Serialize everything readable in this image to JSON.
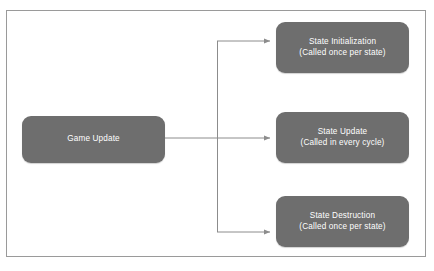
{
  "diagram": {
    "type": "flowchart",
    "colors": {
      "node_fill": "#6e6e6e",
      "node_text": "#ffffff",
      "connector": "#8c8c8c",
      "frame_border": "#9a9a9a",
      "background": "#ffffff"
    },
    "source_node": {
      "id": "game-update",
      "title": "Game Update",
      "subtitle": ""
    },
    "target_nodes": [
      {
        "id": "state-initialization",
        "title": "State Initialization",
        "subtitle": "(Called once per state)"
      },
      {
        "id": "state-update",
        "title": "State Update",
        "subtitle": "(Called in every cycle)"
      },
      {
        "id": "state-destruction",
        "title": "State Destruction",
        "subtitle": "(Called once per state)"
      }
    ],
    "connectors": [
      {
        "id": "game-update-to-state-initialization",
        "from": "game-update",
        "to": "state-initialization"
      },
      {
        "id": "game-update-to-state-update",
        "from": "game-update",
        "to": "state-update"
      },
      {
        "id": "game-update-to-state-destruction",
        "from": "game-update",
        "to": "state-destruction"
      }
    ]
  }
}
